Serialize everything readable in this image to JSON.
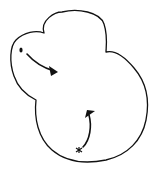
{
  "diagram": {
    "type": "hand-drawn sketch",
    "background": "#ffffff",
    "stroke_color": "#111111",
    "shapes": [
      {
        "name": "lobed-outline",
        "description": "Closed cloud-like outline with three lobes (upper-left, top, lower-right large body)"
      },
      {
        "name": "start-dot",
        "description": "Small filled dot at upper-left lobe",
        "position": [
          21,
          50
        ]
      },
      {
        "name": "arrow-1",
        "description": "Curved arrow from the dot pointing right-downward",
        "from": [
          27,
          54
        ],
        "to": [
          58,
          72
        ]
      },
      {
        "name": "star-mark",
        "description": "Small asterisk-like mark near bottom",
        "position": [
          79,
          150
        ]
      },
      {
        "name": "arrow-2",
        "description": "Curved arrow from the star mark pointing upward",
        "from": [
          83,
          147
        ],
        "to": [
          92,
          112
        ]
      }
    ]
  }
}
